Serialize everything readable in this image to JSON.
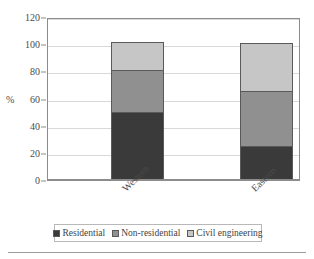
{
  "chart_data": {
    "type": "bar",
    "subtype": "stacked-bar",
    "title": "",
    "xlabel": "",
    "ylabel": "%",
    "ylim": [
      0,
      120
    ],
    "yticks": [
      0,
      20,
      40,
      60,
      80,
      100,
      120
    ],
    "ytick_labels": [
      "0",
      "20",
      "40",
      "60",
      "80",
      "100",
      "120"
    ],
    "grid": "horizontal",
    "legend_position": "bottom",
    "categories": [
      "Western",
      "Eastern"
    ],
    "series": [
      {
        "name": "Residential",
        "color": "#3a3a3a",
        "values": [
          49,
          24.5
        ]
      },
      {
        "name": "Non-residential",
        "color": "#909090",
        "values": [
          31,
          40
        ]
      },
      {
        "name": "Civil engineering",
        "color": "#c6c6c6",
        "values": [
          21,
          35.5
        ]
      }
    ],
    "totals": [
      101,
      100
    ]
  },
  "axis": {
    "y_title": "%"
  },
  "legend": {
    "items": [
      {
        "label": "Residential"
      },
      {
        "label": "Non-residential"
      },
      {
        "label": "Civil engineering"
      }
    ]
  }
}
